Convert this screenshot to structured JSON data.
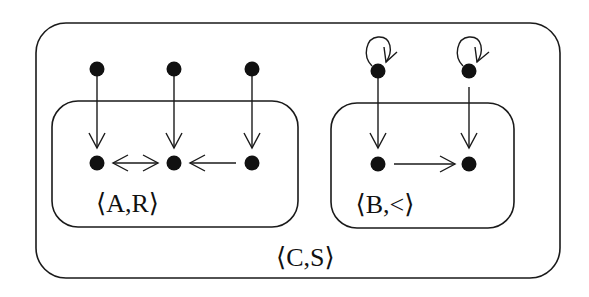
{
  "structures": {
    "outer": {
      "label": "⟨C,S⟩"
    },
    "left": {
      "label": "⟨A,R⟩"
    },
    "right": {
      "label": "⟨B,<⟩"
    }
  },
  "nodes": [
    {
      "id": "c1",
      "group": "outer"
    },
    {
      "id": "c2",
      "group": "outer"
    },
    {
      "id": "c3",
      "group": "outer"
    },
    {
      "id": "c4",
      "group": "outer",
      "self_loop": true
    },
    {
      "id": "c5",
      "group": "outer",
      "self_loop": true
    },
    {
      "id": "a1",
      "group": "left"
    },
    {
      "id": "a2",
      "group": "left"
    },
    {
      "id": "a3",
      "group": "left"
    },
    {
      "id": "b1",
      "group": "right"
    },
    {
      "id": "b2",
      "group": "right"
    }
  ],
  "edges": [
    {
      "from": "c1",
      "to": "a1",
      "type": "map"
    },
    {
      "from": "c2",
      "to": "a2",
      "type": "map"
    },
    {
      "from": "c3",
      "to": "a3",
      "type": "map"
    },
    {
      "from": "c4",
      "to": "b1",
      "type": "map"
    },
    {
      "from": "c5",
      "to": "b2",
      "type": "map"
    },
    {
      "from": "a1",
      "to": "a2",
      "type": "relation",
      "bidirectional": true
    },
    {
      "from": "a3",
      "to": "a2",
      "type": "relation"
    },
    {
      "from": "b1",
      "to": "b2",
      "type": "relation"
    },
    {
      "from": "c4",
      "to": "c4",
      "type": "self-loop"
    },
    {
      "from": "c5",
      "to": "c5",
      "type": "self-loop"
    }
  ]
}
